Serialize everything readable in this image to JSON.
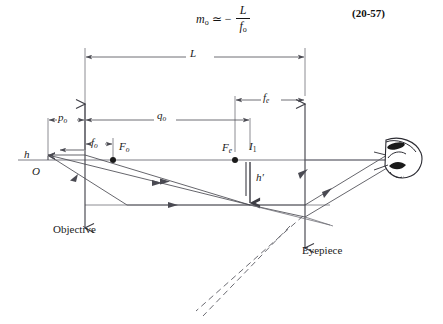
{
  "equation": {
    "variable": "m",
    "variable_sub": "o",
    "relation": "≃",
    "sign": "−",
    "numerator": "L",
    "denominator": "f",
    "denominator_sub": "o",
    "number": "(20-57)"
  },
  "diagram": {
    "dimension_labels": {
      "total_length": "L",
      "eyepiece_focal": "f",
      "eyepiece_focal_sub": "e",
      "object_distance": "p",
      "object_distance_sub": "o",
      "image_distance": "q",
      "image_distance_sub": "o",
      "objective_focal": "f",
      "objective_focal_sub": "o"
    },
    "point_labels": {
      "objective_focus": "F",
      "objective_focus_sub": "o",
      "eyepiece_focus": "F",
      "eyepiece_focus_sub": "e",
      "intermediate_image": "I",
      "intermediate_image_sub": "1",
      "object_height": "h",
      "object_origin": "O",
      "image_height": "h",
      "image_height_prime": "′"
    },
    "component_labels": {
      "objective": "Objective",
      "eyepiece": "Eyepiece"
    },
    "colors": {
      "ink": "#1a1a1a",
      "ray": "#4a4a52",
      "axis": "#6e6e76",
      "dashed": "#5a5a62",
      "background": "#ffffff"
    },
    "geometry": {
      "axis_y": 160,
      "objective_x": 85,
      "eyepiece_x": 305,
      "object_x": 48,
      "object_top_y": 155,
      "image_x": 250,
      "image_bottom_y": 205,
      "Fo_x": 113,
      "Fe_x": 235,
      "L_span": [
        85,
        305
      ],
      "fe_span": [
        235,
        305
      ],
      "po_span": [
        48,
        85
      ],
      "qo_span": [
        85,
        250
      ],
      "fo_span": [
        85,
        113
      ]
    }
  }
}
